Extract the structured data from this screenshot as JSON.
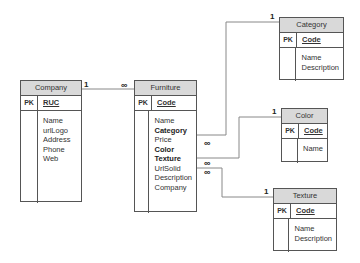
{
  "entities": {
    "company": {
      "title": "Company",
      "pk_label": "PK",
      "pk": "RUC",
      "attributes": [
        "Name",
        "urlLogo",
        "Address",
        "Phone",
        "Web"
      ]
    },
    "furniture": {
      "title": "Furniture",
      "pk_label": "PK",
      "pk": "Code",
      "attributes": [
        {
          "name": "Name",
          "fk": false
        },
        {
          "name": "Category",
          "fk": true
        },
        {
          "name": "Price",
          "fk": false
        },
        {
          "name": "Color",
          "fk": true
        },
        {
          "name": "Texture",
          "fk": true
        },
        {
          "name": "UrlSolid",
          "fk": false
        },
        {
          "name": "Description",
          "fk": false
        },
        {
          "name": "Company",
          "fk": false
        }
      ]
    },
    "category": {
      "title": "Category",
      "pk_label": "PK",
      "pk": "Code",
      "attributes": [
        "Name",
        "Description"
      ]
    },
    "color": {
      "title": "Color",
      "pk_label": "PK",
      "pk": "Code",
      "attributes": [
        "Name"
      ]
    },
    "texture": {
      "title": "Texture",
      "pk_label": "PK",
      "pk": "Code",
      "attributes": [
        "Name",
        "Description"
      ]
    }
  },
  "relationships": [
    {
      "from": "Company",
      "to": "Furniture",
      "from_card": "1",
      "to_card": "∞"
    },
    {
      "from": "Category",
      "to": "Furniture",
      "from_card": "1",
      "to_card": "∞"
    },
    {
      "from": "Color",
      "to": "Furniture",
      "from_card": "1",
      "to_card": "∞"
    },
    {
      "from": "Texture",
      "to": "Furniture",
      "from_card": "1",
      "to_card": "∞"
    }
  ],
  "colors": {
    "header_fill": "#d9d9d9",
    "border": "#555555",
    "line": "#888888"
  }
}
